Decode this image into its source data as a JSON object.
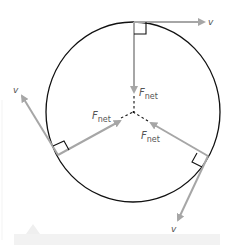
{
  "diagram": {
    "colors": {
      "circle": "#111111",
      "arrow": "#a6a6a6",
      "label": "#555555",
      "right_angle": "#111111",
      "dashed": "#111111",
      "bottom_bar": "#f2f2f2"
    },
    "circle": {
      "cx": 133,
      "cy": 112,
      "r": 87
    },
    "center": {
      "x": 133,
      "y": 112
    },
    "points": [
      {
        "name": "top",
        "velocity_label": "v",
        "force_label_main": "F",
        "force_label_sub": "net"
      },
      {
        "name": "left",
        "velocity_label": "v",
        "force_label_main": "F",
        "force_label_sub": "net"
      },
      {
        "name": "right",
        "velocity_label": "v",
        "force_label_main": "F",
        "force_label_sub": "net"
      }
    ]
  }
}
